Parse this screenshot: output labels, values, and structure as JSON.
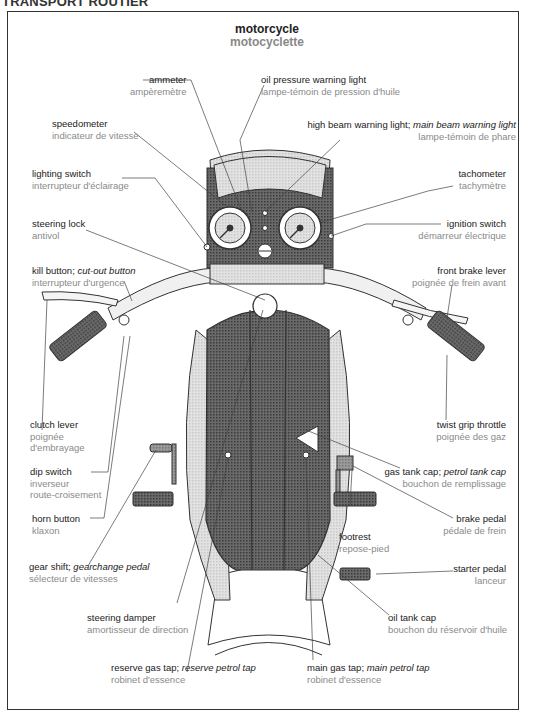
{
  "section": "TRANSPORT ROUTIER",
  "title": {
    "en": "motorcycle",
    "fr": "motocyclette"
  },
  "labels": {
    "ammeter": {
      "en": "ammeter",
      "fr": "ampèremètre"
    },
    "oil_pressure": {
      "en": "oil pressure warning light",
      "fr": "lampe-témoin de pression d'huile"
    },
    "speedometer": {
      "en": "speedometer",
      "fr": "indicateur de vitesse"
    },
    "high_beam": {
      "en": "high beam warning light; ",
      "en_alt": "main beam warning light",
      "fr": "lampe-témoin de phare"
    },
    "lighting_switch": {
      "en": "lighting switch",
      "fr": "interrupteur d'éclairage"
    },
    "tachometer": {
      "en": "tachometer",
      "fr": "tachymètre"
    },
    "steering_lock": {
      "en": "steering lock",
      "fr": "antivol"
    },
    "ignition_switch": {
      "en": "ignition switch",
      "fr": "démarreur électrique"
    },
    "kill_button": {
      "en": "kill button; ",
      "en_alt": "cut-out button",
      "fr": "interrupteur d'urgence"
    },
    "front_brake": {
      "en": "front brake lever",
      "fr": "poignée de frein avant"
    },
    "clutch_lever": {
      "en": "clutch lever",
      "fr1": "poignée",
      "fr2": "d'embrayage"
    },
    "twist_grip": {
      "en": "twist grip throttle",
      "fr": "poignée des gaz"
    },
    "dip_switch": {
      "en": "dip switch",
      "fr1": "inverseur",
      "fr2": "route-croisement"
    },
    "gas_tank_cap": {
      "en": "gas tank cap; ",
      "en_alt": "petrol tank cap",
      "fr": "bouchon de remplissage"
    },
    "horn_button": {
      "en": "horn button",
      "fr": "klaxon"
    },
    "brake_pedal": {
      "en": "brake pedal",
      "fr": "pédale de frein"
    },
    "footrest": {
      "en": "footrest",
      "fr": "repose-pied"
    },
    "gear_shift": {
      "en": "gear shift; ",
      "en_alt": "gearchange pedal",
      "fr": "sélecteur de vitesses"
    },
    "starter_pedal": {
      "en": "starter pedal",
      "fr": "lanceur"
    },
    "steering_damper": {
      "en": "steering damper",
      "fr": "amortisseur de direction"
    },
    "oil_tank_cap": {
      "en": "oil tank cap",
      "fr": "bouchon du réservoir d'huile"
    },
    "reserve_tap": {
      "en": "reserve gas tap; ",
      "en_alt": "reserve petrol tap",
      "fr": "robinet d'essence"
    },
    "main_tap": {
      "en": "main gas tap; ",
      "en_alt": "main petrol tap",
      "fr": "robinet d'essence"
    }
  },
  "colors": {
    "frame": "#333333",
    "label_en": "#222222",
    "label_fr": "#8a8a8a",
    "shading_dark": "#5a5a5a",
    "shading_light": "#d9d9d9"
  }
}
